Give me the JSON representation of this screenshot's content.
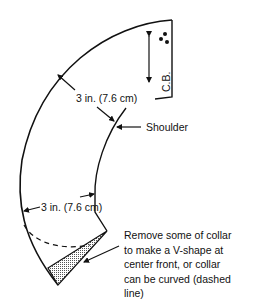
{
  "diagram": {
    "type": "collar pattern",
    "labels": {
      "width_top": "3 in. (7.6 cm)",
      "shoulder": "Shoulder",
      "width_bottom": "3 in. (7.6 cm)",
      "center_back": "C.B.",
      "note_lines": [
        "Remove some of collar",
        "to make a V-shape at",
        "center front, or collar",
        "can be curved (dashed",
        "line)"
      ]
    },
    "symbols": {
      "grainline": "double-headed-arrow",
      "fold_marker": "three-dots"
    },
    "colors": {
      "line": "#111111",
      "shading": "#b8b8b8"
    }
  }
}
